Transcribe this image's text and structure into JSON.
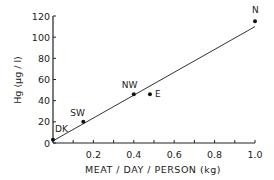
{
  "chart_data": {
    "type": "scatter",
    "title": "",
    "xlabel": "MEAT / DAY / PERSON  (kg)",
    "ylabel": "Hg  (μg / l)",
    "xlim": [
      0,
      1.0
    ],
    "ylim": [
      0,
      120
    ],
    "xticks": [
      0.2,
      0.4,
      0.6,
      0.8,
      1.0
    ],
    "xtick_labels": [
      "0.2",
      "0.4",
      "0.6",
      "0.8",
      "1.0"
    ],
    "yticks": [
      0,
      20,
      40,
      60,
      80,
      100,
      120
    ],
    "ytick_labels": [
      "0",
      "20",
      "40",
      "60",
      "80",
      "100",
      "120"
    ],
    "grid": false,
    "legend": null,
    "points": [
      {
        "label": "DK",
        "x": 0.0,
        "y": 3
      },
      {
        "label": "SW",
        "x": 0.15,
        "y": 20
      },
      {
        "label": "NW",
        "x": 0.4,
        "y": 46
      },
      {
        "label": "E",
        "x": 0.48,
        "y": 46
      },
      {
        "label": "N",
        "x": 1.0,
        "y": 115
      }
    ],
    "fit_line": {
      "x": [
        0.0,
        1.0
      ],
      "y": [
        2,
        110
      ]
    }
  }
}
